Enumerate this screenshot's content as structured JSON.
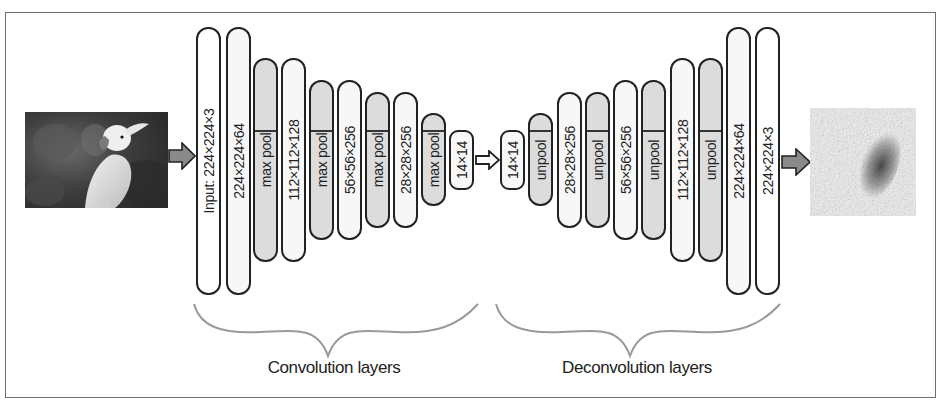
{
  "diagram": {
    "input_image": {
      "subject": "cockatoo photo (grayscale)"
    },
    "output_image": {
      "subject": "noisy reconstruction / heatmap"
    },
    "encoder": {
      "caption": "Convolution layers",
      "layers": [
        {
          "label": "Input: 224×224×3",
          "type": "input",
          "x": 196,
          "top": 27,
          "bottom": 295
        },
        {
          "label": "224×224×64",
          "type": "feat",
          "x": 226,
          "top": 27,
          "bottom": 295
        },
        {
          "label": "max pool",
          "type": "pool",
          "x": 253,
          "top": 58,
          "bottom": 262
        },
        {
          "label": "112×112×128",
          "type": "feat",
          "x": 281,
          "top": 58,
          "bottom": 262
        },
        {
          "label": "max pool",
          "type": "pool",
          "x": 309,
          "top": 80,
          "bottom": 240
        },
        {
          "label": "56×56×256",
          "type": "feat",
          "x": 337,
          "top": 80,
          "bottom": 240
        },
        {
          "label": "max pool",
          "type": "pool",
          "x": 365,
          "top": 92,
          "bottom": 228
        },
        {
          "label": "28×28×256",
          "type": "feat",
          "x": 393,
          "top": 92,
          "bottom": 228
        },
        {
          "label": "max pool",
          "type": "pool",
          "x": 421,
          "top": 113,
          "bottom": 206
        },
        {
          "label": "14×14",
          "type": "feat",
          "x": 449,
          "top": 130,
          "bottom": 190
        }
      ]
    },
    "decoder": {
      "caption": "Deconvolution layers",
      "layers": [
        {
          "label": "14×14",
          "type": "feat",
          "x": 500,
          "top": 130,
          "bottom": 190
        },
        {
          "label": "unpool",
          "type": "pool",
          "x": 528,
          "top": 113,
          "bottom": 206
        },
        {
          "label": "28×28×256",
          "type": "feat",
          "x": 557,
          "top": 92,
          "bottom": 228
        },
        {
          "label": "unpool",
          "type": "pool",
          "x": 585,
          "top": 92,
          "bottom": 228
        },
        {
          "label": "56×56×256",
          "type": "feat",
          "x": 613,
          "top": 80,
          "bottom": 240
        },
        {
          "label": "unpool",
          "type": "pool",
          "x": 641,
          "top": 80,
          "bottom": 240
        },
        {
          "label": "112×112×128",
          "type": "feat",
          "x": 670,
          "top": 58,
          "bottom": 262
        },
        {
          "label": "unpool",
          "type": "pool",
          "x": 698,
          "top": 58,
          "bottom": 262
        },
        {
          "label": "224×224×64",
          "type": "feat",
          "x": 726,
          "top": 27,
          "bottom": 295
        },
        {
          "label": "224×224×3",
          "type": "input",
          "x": 755,
          "top": 27,
          "bottom": 295
        }
      ]
    },
    "colors": {
      "block_border": "#222222",
      "pool_fill": "#dcdcdc",
      "feature_fill": "#f7f7f7",
      "arrow_fill": "#8a8a8a",
      "brace": "#9a9a9a",
      "frame": "#6e6e6e"
    }
  }
}
